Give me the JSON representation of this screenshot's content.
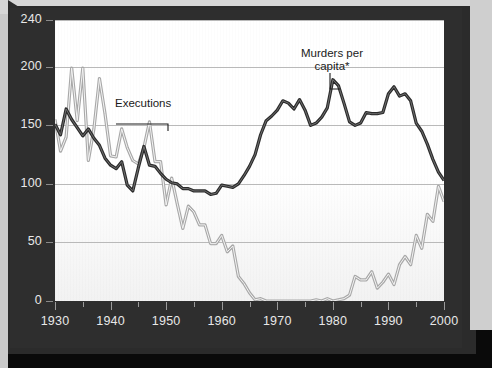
{
  "chart_data": {
    "type": "line",
    "title": "",
    "xlabel": "",
    "ylabel": "",
    "xlim": [
      1930,
      2000
    ],
    "ylim": [
      0,
      240
    ],
    "yticks": [
      0,
      50,
      100,
      150,
      200,
      240
    ],
    "xticks": [
      1930,
      1940,
      1950,
      1960,
      1970,
      1980,
      1990,
      2000
    ],
    "x_minor_step": 5,
    "grid": "horizontal",
    "legend": "inline-annotations",
    "footnote": "*per 66,000 people",
    "annotations": [
      {
        "text": "Executions",
        "x": 1943,
        "series": "Executions"
      },
      {
        "text": "Murders per capita*",
        "x": 1978,
        "series": "Murders per capita*"
      }
    ],
    "series": [
      {
        "name": "Executions",
        "color": "#a8a8a8",
        "x": [
          1930,
          1931,
          1932,
          1933,
          1934,
          1935,
          1936,
          1937,
          1938,
          1939,
          1940,
          1941,
          1942,
          1943,
          1944,
          1945,
          1946,
          1947,
          1948,
          1949,
          1950,
          1951,
          1952,
          1953,
          1954,
          1955,
          1956,
          1957,
          1958,
          1959,
          1960,
          1961,
          1962,
          1963,
          1964,
          1965,
          1966,
          1967,
          1968,
          1969,
          1970,
          1971,
          1972,
          1973,
          1974,
          1975,
          1976,
          1977,
          1978,
          1979,
          1980,
          1981,
          1982,
          1983,
          1984,
          1985,
          1986,
          1987,
          1988,
          1989,
          1990,
          1991,
          1992,
          1993,
          1994,
          1995,
          1996,
          1997,
          1998,
          1999,
          2000
        ],
        "values": [
          155,
          128,
          140,
          199,
          154,
          199,
          120,
          147,
          190,
          160,
          124,
          123,
          147,
          131,
          120,
          117,
          131,
          153,
          119,
          119,
          82,
          105,
          83,
          62,
          81,
          76,
          65,
          65,
          49,
          49,
          56,
          42,
          47,
          21,
          15,
          7,
          1,
          2,
          0,
          0,
          0,
          0,
          0,
          0,
          0,
          0,
          0,
          1,
          0,
          2,
          0,
          1,
          2,
          5,
          21,
          18,
          18,
          25,
          11,
          16,
          23,
          14,
          31,
          38,
          31,
          56,
          45,
          74,
          68,
          98,
          85
        ]
      },
      {
        "name": "Murders per capita*",
        "color": "#2b2b2b",
        "x": [
          1930,
          1931,
          1932,
          1933,
          1934,
          1935,
          1936,
          1937,
          1938,
          1939,
          1940,
          1941,
          1942,
          1943,
          1944,
          1945,
          1946,
          1947,
          1948,
          1949,
          1950,
          1951,
          1952,
          1953,
          1954,
          1955,
          1956,
          1957,
          1958,
          1959,
          1960,
          1961,
          1962,
          1963,
          1964,
          1965,
          1966,
          1967,
          1968,
          1969,
          1970,
          1971,
          1972,
          1973,
          1974,
          1975,
          1976,
          1977,
          1978,
          1979,
          1980,
          1981,
          1982,
          1983,
          1984,
          1985,
          1986,
          1987,
          1988,
          1989,
          1990,
          1991,
          1992,
          1993,
          1994,
          1995,
          1996,
          1997,
          1998,
          1999,
          2000
        ],
        "values": [
          151,
          142,
          164,
          155,
          148,
          141,
          147,
          139,
          133,
          122,
          116,
          113,
          119,
          99,
          94,
          114,
          132,
          116,
          115,
          109,
          104,
          101,
          100,
          96,
          96,
          94,
          94,
          94,
          91,
          92,
          99,
          98,
          97,
          100,
          107,
          115,
          125,
          142,
          154,
          158,
          163,
          171,
          169,
          164,
          172,
          163,
          150,
          152,
          157,
          165,
          189,
          184,
          169,
          153,
          150,
          152,
          161,
          160,
          160,
          161,
          177,
          183,
          175,
          177,
          171,
          152,
          145,
          134,
          121,
          110,
          103
        ]
      }
    ]
  },
  "axes": {
    "y_labels": [
      "240",
      "200",
      "150",
      "100",
      "50",
      "0"
    ],
    "x_labels": [
      "1930",
      "1940",
      "1950",
      "1960",
      "1970",
      "1980",
      "1990",
      "2000"
    ]
  },
  "labels": {
    "executions": "Executions",
    "murders_line1": "Murders per",
    "murders_line2": "capita*",
    "footnote": "*per 66,000 people"
  },
  "colors": {
    "executions": "#a8a8a8",
    "murders": "#2b2b2b",
    "frame": "#2b2b2b",
    "grid": "#b9b9b9",
    "plot_bg": "#ffffff"
  }
}
